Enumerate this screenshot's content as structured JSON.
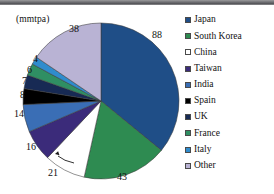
{
  "chart_data": {
    "type": "pie",
    "title": "",
    "unit_label": "(mmtpa)",
    "categories": [
      "Japan",
      "South Korea",
      "China",
      "Taiwan",
      "India",
      "Spain",
      "UK",
      "France",
      "Italy",
      "Other"
    ],
    "values": [
      88,
      43,
      21,
      16,
      14,
      8,
      7,
      6,
      4,
      38
    ],
    "total": 245,
    "data_labels": [
      "88",
      "43",
      "21",
      "16",
      "14",
      "8",
      "7",
      "6",
      "4",
      "38"
    ],
    "colors": [
      "#1f4e87",
      "#2e8b51",
      "#ffffff",
      "#3b2b7a",
      "#3a6eb5",
      "#000000",
      "#172a54",
      "#2f8f63",
      "#2f8ccd",
      "#b9b3d4"
    ],
    "legend_position": "right",
    "start_angle_deg": 0,
    "direction": "clockwise",
    "grid": false
  },
  "legend": {
    "items": [
      {
        "label": "Japan",
        "color": "#1f4e87"
      },
      {
        "label": "South Korea",
        "color": "#2e8b51"
      },
      {
        "label": "China",
        "color": "#ffffff"
      },
      {
        "label": "Taiwan",
        "color": "#3b2b7a"
      },
      {
        "label": "India",
        "color": "#3a6eb5"
      },
      {
        "label": "Spain",
        "color": "#000000"
      },
      {
        "label": "UK",
        "color": "#172a54"
      },
      {
        "label": "France",
        "color": "#2f8f63"
      },
      {
        "label": "Italy",
        "color": "#2f8ccd"
      },
      {
        "label": "Other",
        "color": "#b9b3d4"
      }
    ]
  },
  "labels": {
    "japan": "88",
    "south_korea": "43",
    "china": "21",
    "taiwan": "16",
    "india": "14",
    "spain": "8",
    "uk": "7",
    "france": "6",
    "italy": "4",
    "other": "38",
    "unit": "(mmtpa)"
  }
}
